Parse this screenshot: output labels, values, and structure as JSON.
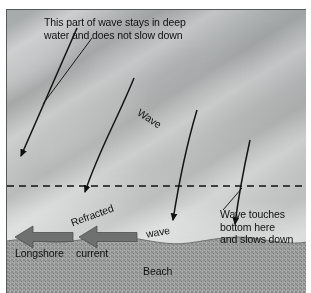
{
  "figure": {
    "border_color": "#555a5c",
    "water_color": "#b2b4b4",
    "beach_color": "#9a9c9b",
    "ink_color": "#101010"
  },
  "annotations": {
    "deep_water_note_line1": "This part of wave stays in deep",
    "deep_water_note_line2": "water and does not slow down",
    "touches_bottom_line1": "Wave touches",
    "touches_bottom_line2": "bottom here",
    "touches_bottom_line3": "and slows down",
    "wave_deep_label": "Wave",
    "refracted_label": "Refracted",
    "wave_shallow_label": "wave",
    "longshore_label": "Longshore",
    "current_label": "current",
    "beach_label": "Beach"
  },
  "elements": {
    "depth_line_name": "wave-base-dashed-line",
    "depth_line_style": "dashed",
    "depth_line_y": 176,
    "wave_direction_arrow_count": 4,
    "longshore_arrow_count": 2,
    "longshore_arrow_direction": "left",
    "wave_crest_band_count": 5
  }
}
